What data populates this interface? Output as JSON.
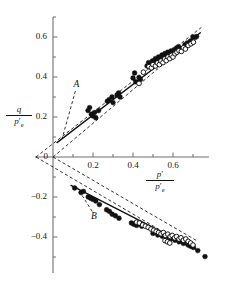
{
  "figure": {
    "background": "#ffffff",
    "ink": "#111111",
    "axis_color": "#6f6f6f"
  },
  "axes": {
    "x_label": {
      "numerator": "p",
      "numerator_prime": "′",
      "denominator": "p",
      "denominator_prime": "′",
      "denominator_sub": "e"
    },
    "y_label": {
      "numerator": "q",
      "denominator": "p",
      "denominator_prime": "′",
      "denominator_sub": "e"
    },
    "x_ticks": [
      {
        "value": 0.2,
        "label": "0.2"
      },
      {
        "value": 0.4,
        "label": "0.4"
      },
      {
        "value": 0.6,
        "label": "0.6"
      }
    ],
    "x_minor_ticks": [
      0.1,
      0.3,
      0.5,
      0.7
    ],
    "y_ticks": [
      {
        "value": 0.6,
        "label": "0.6"
      },
      {
        "value": 0.4,
        "label": "0.4"
      },
      {
        "value": 0.2,
        "label": "0.2"
      },
      {
        "value": 0.0,
        "label": "0"
      },
      {
        "value": -0.2,
        "label": "−0.2"
      },
      {
        "value": -0.4,
        "label": "−0.4"
      }
    ],
    "y_minor_ticks": [
      0.7,
      0.5,
      0.3,
      0.1,
      -0.1,
      -0.3,
      -0.5
    ],
    "xlim": [
      -0.09,
      0.78
    ],
    "ylim": [
      -0.58,
      0.7
    ],
    "grid": false
  },
  "annotations": [
    {
      "name": "label-A",
      "text": "A",
      "x": 0.118,
      "y": 0.36
    },
    {
      "name": "label-B",
      "text": "B",
      "x": 0.205,
      "y": -0.3
    }
  ],
  "chart_data": {
    "type": "scatter",
    "title": "",
    "xlabel": "p'/p'e",
    "ylabel": "q/p'e",
    "xlim": [
      -0.09,
      0.78
    ],
    "ylim": [
      -0.58,
      0.7
    ],
    "grid": false,
    "legend": "none",
    "series": [
      {
        "name": "compression-filled",
        "marker": "filled-circle",
        "color": "#111111",
        "points": [
          [
            0.175,
            0.232
          ],
          [
            0.183,
            0.247
          ],
          [
            0.192,
            0.214
          ],
          [
            0.2,
            0.205
          ],
          [
            0.207,
            0.222
          ],
          [
            0.214,
            0.196
          ],
          [
            0.228,
            0.232
          ],
          [
            0.272,
            0.279
          ],
          [
            0.281,
            0.287
          ],
          [
            0.295,
            0.3
          ],
          [
            0.3,
            0.272
          ],
          [
            0.32,
            0.31
          ],
          [
            0.328,
            0.32
          ],
          [
            0.335,
            0.3
          ],
          [
            0.4,
            0.395
          ],
          [
            0.408,
            0.42
          ],
          [
            0.414,
            0.376
          ],
          [
            0.43,
            0.398
          ],
          [
            0.437,
            0.387
          ],
          [
            0.47,
            0.455
          ],
          [
            0.478,
            0.472
          ],
          [
            0.486,
            0.464
          ],
          [
            0.497,
            0.48
          ],
          [
            0.505,
            0.47
          ],
          [
            0.512,
            0.492
          ],
          [
            0.52,
            0.478
          ],
          [
            0.528,
            0.5
          ],
          [
            0.536,
            0.486
          ],
          [
            0.545,
            0.51
          ],
          [
            0.552,
            0.498
          ],
          [
            0.56,
            0.518
          ],
          [
            0.566,
            0.505
          ],
          [
            0.574,
            0.524
          ],
          [
            0.582,
            0.512
          ],
          [
            0.59,
            0.53
          ],
          [
            0.598,
            0.518
          ],
          [
            0.606,
            0.536
          ],
          [
            0.618,
            0.545
          ],
          [
            0.628,
            0.552
          ],
          [
            0.64,
            0.54
          ],
          [
            0.66,
            0.562
          ],
          [
            0.672,
            0.57
          ],
          [
            0.688,
            0.58
          ],
          [
            0.7,
            0.6
          ],
          [
            0.71,
            0.598
          ],
          [
            0.718,
            0.602
          ]
        ]
      },
      {
        "name": "compression-open",
        "marker": "open-circle",
        "color": "#111111",
        "points": [
          [
            0.43,
            0.368
          ],
          [
            0.452,
            0.424
          ],
          [
            0.48,
            0.452
          ],
          [
            0.492,
            0.446
          ],
          [
            0.5,
            0.462
          ],
          [
            0.512,
            0.455
          ],
          [
            0.522,
            0.47
          ],
          [
            0.532,
            0.462
          ],
          [
            0.54,
            0.48
          ],
          [
            0.55,
            0.472
          ],
          [
            0.558,
            0.49
          ],
          [
            0.566,
            0.482
          ],
          [
            0.575,
            0.5
          ],
          [
            0.584,
            0.492
          ],
          [
            0.592,
            0.508
          ],
          [
            0.6,
            0.5
          ],
          [
            0.61,
            0.516
          ],
          [
            0.62,
            0.524
          ],
          [
            0.63,
            0.532
          ],
          [
            0.642,
            0.528
          ],
          [
            0.652,
            0.546
          ],
          [
            0.662,
            0.54
          ],
          [
            0.676,
            0.558
          ],
          [
            0.69,
            0.566
          ],
          [
            0.702,
            0.574
          ]
        ]
      },
      {
        "name": "extension-filled",
        "marker": "filled-circle",
        "color": "#111111",
        "points": [
          [
            0.108,
            -0.155
          ],
          [
            0.14,
            -0.178
          ],
          [
            0.152,
            -0.172
          ],
          [
            0.176,
            -0.2
          ],
          [
            0.188,
            -0.206
          ],
          [
            0.2,
            -0.212
          ],
          [
            0.214,
            -0.22
          ],
          [
            0.232,
            -0.238
          ],
          [
            0.268,
            -0.264
          ],
          [
            0.282,
            -0.272
          ],
          [
            0.296,
            -0.286
          ],
          [
            0.312,
            -0.294
          ],
          [
            0.33,
            -0.306
          ],
          [
            0.392,
            -0.33
          ],
          [
            0.404,
            -0.336
          ],
          [
            0.418,
            -0.342
          ],
          [
            0.432,
            -0.334
          ],
          [
            0.444,
            -0.346
          ],
          [
            0.5,
            -0.382
          ],
          [
            0.512,
            -0.376
          ],
          [
            0.524,
            -0.39
          ],
          [
            0.534,
            -0.384
          ],
          [
            0.546,
            -0.396
          ],
          [
            0.556,
            -0.39
          ],
          [
            0.566,
            -0.402
          ],
          [
            0.578,
            -0.398
          ],
          [
            0.588,
            -0.41
          ],
          [
            0.598,
            -0.404
          ],
          [
            0.61,
            -0.416
          ],
          [
            0.62,
            -0.412
          ],
          [
            0.63,
            -0.424
          ],
          [
            0.642,
            -0.42
          ],
          [
            0.652,
            -0.432
          ],
          [
            0.664,
            -0.428
          ],
          [
            0.676,
            -0.44
          ],
          [
            0.688,
            -0.446
          ],
          [
            0.702,
            -0.452
          ],
          [
            0.724,
            -0.468
          ],
          [
            0.76,
            -0.498
          ]
        ]
      },
      {
        "name": "extension-open",
        "marker": "open-circle",
        "color": "#111111",
        "points": [
          [
            0.418,
            -0.326
          ],
          [
            0.432,
            -0.33
          ],
          [
            0.448,
            -0.34
          ],
          [
            0.462,
            -0.346
          ],
          [
            0.476,
            -0.352
          ],
          [
            0.49,
            -0.36
          ],
          [
            0.504,
            -0.366
          ],
          [
            0.516,
            -0.372
          ],
          [
            0.528,
            -0.378
          ],
          [
            0.54,
            -0.384
          ],
          [
            0.552,
            -0.378
          ],
          [
            0.562,
            -0.392
          ],
          [
            0.574,
            -0.386
          ],
          [
            0.586,
            -0.398
          ],
          [
            0.596,
            -0.392
          ],
          [
            0.608,
            -0.404
          ],
          [
            0.618,
            -0.398
          ],
          [
            0.63,
            -0.41
          ],
          [
            0.64,
            -0.404
          ],
          [
            0.652,
            -0.416
          ],
          [
            0.664,
            -0.41
          ],
          [
            0.676,
            -0.422
          ],
          [
            0.688,
            -0.43
          ],
          [
            0.7,
            -0.44
          ],
          [
            0.56,
            -0.418
          ],
          [
            0.572,
            -0.424
          ],
          [
            0.584,
            -0.43
          ]
        ]
      }
    ],
    "fit_lines": [
      {
        "name": "compression-best-fit",
        "style": "solid",
        "x0": 0.02,
        "y0": 0.072,
        "x1": 0.735,
        "y1": 0.62
      },
      {
        "name": "extension-best-fit",
        "style": "solid",
        "x0": 0.09,
        "y0": -0.142,
        "x1": 0.715,
        "y1": -0.462
      }
    ],
    "origin_lines": [
      {
        "name": "compression-upper-envelope",
        "style": "dashed",
        "x0": -0.085,
        "y0": 0.0,
        "x1": 0.742,
        "y1": 0.648
      },
      {
        "name": "compression-lower-envelope",
        "style": "dashed",
        "x0": 0.0,
        "y0": 0.0,
        "x1": 0.742,
        "y1": 0.625
      },
      {
        "name": "extension-upper-envelope",
        "style": "dashed",
        "x0": 0.0,
        "y0": 0.0,
        "x1": 0.718,
        "y1": -0.418
      },
      {
        "name": "extension-lower-envelope",
        "style": "dashed",
        "x0": -0.085,
        "y0": 0.0,
        "x1": 0.7,
        "y1": -0.462
      }
    ],
    "leaders": [
      {
        "name": "leader-A",
        "x0": 0.112,
        "y0": 0.33,
        "x1": 0.045,
        "y1": 0.09
      },
      {
        "name": "leader-B",
        "x0": 0.196,
        "y0": -0.272,
        "x1": 0.12,
        "y1": -0.152
      }
    ]
  }
}
